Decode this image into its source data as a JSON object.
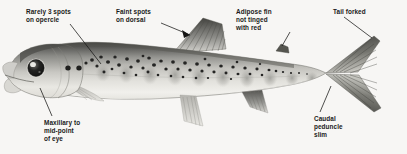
{
  "figure": {
    "background_color": "#f7f6f4",
    "text_color": "#1a1a1a",
    "width": 407,
    "height": 154
  },
  "labels": [
    {
      "id": "opercle",
      "name": "label-rarely-3-spots-on-opercle",
      "lines": [
        "Rarely 3 spots",
        "on opercle"
      ],
      "leader": {
        "x1": 70,
        "y1": 24,
        "x2": 101,
        "y2": 64
      }
    },
    {
      "id": "dorsal",
      "name": "label-faint-spots-on-dorsal",
      "lines": [
        "Faint spots",
        "on dorsal"
      ],
      "leader": {
        "x1": 161,
        "y1": 23,
        "x2": 187,
        "y2": 34
      }
    },
    {
      "id": "adipose",
      "name": "label-adipose-fin-not-tinged-with-red",
      "lines": [
        "Adipose fin",
        "not tinged",
        "with red"
      ],
      "leader": {
        "x1": 289,
        "y1": 33,
        "x2": 281,
        "y2": 47
      }
    },
    {
      "id": "tail",
      "name": "label-tail-forked",
      "lines": [
        "Tail forked"
      ],
      "leader": {
        "x1": 344,
        "y1": 17,
        "x2": 372,
        "y2": 37
      }
    },
    {
      "id": "maxillary",
      "name": "label-maxillary-to-mid-point-of-eye",
      "lines": [
        "Maxillary to",
        "mid-point",
        "of eye"
      ],
      "leader": {
        "x1": 52,
        "y1": 116,
        "x2": 40,
        "y2": 88
      }
    },
    {
      "id": "peduncle",
      "name": "label-caudal-peduncle-slim",
      "lines": [
        "Caudal",
        "peduncle",
        "slim"
      ],
      "leader": {
        "x1": 320,
        "y1": 112,
        "x2": 330,
        "y2": 85
      }
    }
  ],
  "illustration": {
    "name": "fish-side-view",
    "species_features": {
      "eye": {
        "cx": 36,
        "cy": 68,
        "r": 8.2,
        "highlight": true
      },
      "opercle_spots": [
        {
          "cx": 68,
          "cy": 68,
          "r": 2.6
        },
        {
          "cx": 79,
          "cy": 68,
          "r": 2.6
        }
      ],
      "adipose_fin": {
        "x": 281,
        "y": 47
      },
      "caudal_fin": "forked",
      "parr_marks_count": 10,
      "body_spots_count": 58
    },
    "colors": {
      "body_dark": "#3c3c3c",
      "body_mid": "#8e8e8c",
      "body_light": "#d8d7d2",
      "belly": "#f2f1ed",
      "spot": "#262626",
      "fin": "#a8a8a4"
    }
  }
}
